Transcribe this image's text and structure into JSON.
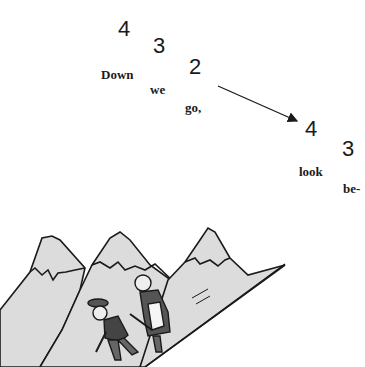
{
  "rhythm": {
    "beats": [
      {
        "number": "4",
        "syllable": "Down"
      },
      {
        "number": "3",
        "syllable": "we"
      },
      {
        "number": "2",
        "syllable": "go,"
      },
      {
        "number": "4",
        "syllable": "look"
      },
      {
        "number": "3",
        "syllable": "be-"
      }
    ]
  },
  "illustration": {
    "subject": "two hikers descending a mountain slope",
    "arrow_direction": "down-right"
  }
}
